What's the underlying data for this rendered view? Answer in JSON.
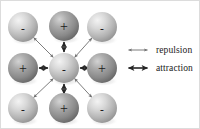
{
  "diagram": {
    "colors": {
      "negative_ion_light": "#cfcfcf",
      "negative_ion_dark": "#9a9a9a",
      "positive_ion_light": "#a8a8a8",
      "positive_ion_dark": "#6b6b6b",
      "sign_color": "#1a1a1a",
      "repulsion_arrow": "#6e6e6e",
      "attraction_arrow": "#262626",
      "text_color": "#1a1a1a",
      "background": "#ffffff"
    },
    "ions": [
      {
        "id": "ion-top-left",
        "charge": "-",
        "row": 0,
        "col": 0,
        "cx": 22,
        "cy": 26,
        "r": 15,
        "type": "negative"
      },
      {
        "id": "ion-top-center",
        "charge": "+",
        "row": 0,
        "col": 1,
        "cx": 63,
        "cy": 25,
        "r": 15,
        "type": "positive"
      },
      {
        "id": "ion-top-right",
        "charge": "-",
        "row": 0,
        "col": 2,
        "cx": 101,
        "cy": 26,
        "r": 15,
        "type": "negative"
      },
      {
        "id": "ion-middle-left",
        "charge": "+",
        "row": 1,
        "col": 0,
        "cx": 22,
        "cy": 67,
        "r": 15,
        "type": "positive"
      },
      {
        "id": "ion-center",
        "charge": "-",
        "row": 1,
        "col": 1,
        "cx": 63,
        "cy": 67,
        "r": 15,
        "type": "negative"
      },
      {
        "id": "ion-middle-right",
        "charge": "+",
        "row": 1,
        "col": 2,
        "cx": 101,
        "cy": 67,
        "r": 15,
        "type": "positive"
      },
      {
        "id": "ion-bottom-left",
        "charge": "-",
        "row": 2,
        "col": 0,
        "cx": 22,
        "cy": 107,
        "r": 15,
        "type": "negative"
      },
      {
        "id": "ion-bottom-center",
        "charge": "+",
        "row": 2,
        "col": 1,
        "cx": 63,
        "cy": 107,
        "r": 15,
        "type": "positive"
      },
      {
        "id": "ion-bottom-right",
        "charge": "-",
        "row": 2,
        "col": 2,
        "cx": 101,
        "cy": 107,
        "r": 15,
        "type": "negative"
      }
    ],
    "force_arrows": [
      {
        "id": "arrow-attraction-up",
        "force": "attraction",
        "from": "ion-center",
        "to": "ion-top-center"
      },
      {
        "id": "arrow-attraction-down",
        "force": "attraction",
        "from": "ion-center",
        "to": "ion-bottom-center"
      },
      {
        "id": "arrow-attraction-left",
        "force": "attraction",
        "from": "ion-center",
        "to": "ion-middle-left"
      },
      {
        "id": "arrow-attraction-right",
        "force": "attraction",
        "from": "ion-center",
        "to": "ion-middle-right"
      },
      {
        "id": "arrow-repulsion-up-left",
        "force": "repulsion",
        "from": "ion-center",
        "to": "ion-top-left"
      },
      {
        "id": "arrow-repulsion-up-right",
        "force": "repulsion",
        "from": "ion-center",
        "to": "ion-top-right"
      },
      {
        "id": "arrow-repulsion-down-left",
        "force": "repulsion",
        "from": "ion-center",
        "to": "ion-bottom-left"
      },
      {
        "id": "arrow-repulsion-down-right",
        "force": "repulsion",
        "from": "ion-center",
        "to": "ion-bottom-right"
      }
    ]
  },
  "legend": {
    "repulsion": {
      "label": "repulsion",
      "arrow_icon": "double-arrow-thin-icon"
    },
    "attraction": {
      "label": "attraction",
      "arrow_icon": "double-arrow-bold-icon"
    }
  }
}
